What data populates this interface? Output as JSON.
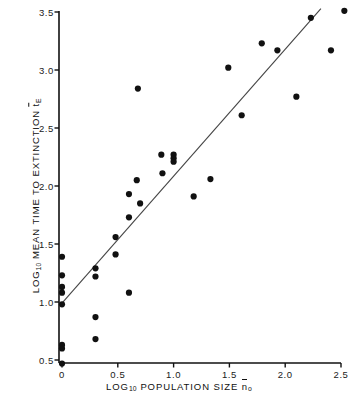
{
  "figure": {
    "background": "#ffffff",
    "ink_color": "#111111",
    "point_color": "#111111",
    "line_color": "#444444"
  },
  "axes": {
    "x_title_prefix": "LOG",
    "x_title_sub": "10",
    "x_title_main": " POPULATION SIZE ",
    "x_title_var": "n",
    "x_title_var_sub": "o",
    "y_title_prefix": "LOG",
    "y_title_sub": "10",
    "y_title_main": " MEAN TIME TO EXTINCTION ",
    "y_title_var": "t",
    "y_title_var_sub": "E",
    "x_ticks": [
      "0",
      "0.5",
      "1.0",
      "1.5",
      "2.0",
      "2.5"
    ],
    "x_tick_values": [
      0,
      0.5,
      1.0,
      1.5,
      2.0,
      2.5
    ],
    "y_ticks": [
      "0.5",
      "1.0",
      "1.5",
      "2.0",
      "2.5",
      "3.0",
      "3.5"
    ],
    "y_tick_values": [
      0.5,
      1.0,
      1.5,
      2.0,
      2.5,
      3.0,
      3.5
    ]
  },
  "chart_data": {
    "type": "scatter",
    "title": "",
    "xlabel": "LOG10 POPULATION SIZE n̂o",
    "ylabel": "LOG10 MEAN TIME TO EXTINCTION t̄E",
    "xlim": [
      0.0,
      2.5
    ],
    "ylim": [
      0.42,
      3.56
    ],
    "grid": false,
    "legend": "none",
    "points": [
      {
        "x": 0.0,
        "y": 1.39
      },
      {
        "x": 0.0,
        "y": 1.23
      },
      {
        "x": 0.0,
        "y": 1.13
      },
      {
        "x": 0.0,
        "y": 1.08
      },
      {
        "x": 0.0,
        "y": 0.98
      },
      {
        "x": 0.0,
        "y": 0.63
      },
      {
        "x": 0.0,
        "y": 0.6
      },
      {
        "x": 0.0,
        "y": 0.47
      },
      {
        "x": 0.3,
        "y": 1.29
      },
      {
        "x": 0.3,
        "y": 1.22
      },
      {
        "x": 0.3,
        "y": 0.87
      },
      {
        "x": 0.3,
        "y": 0.68
      },
      {
        "x": 0.48,
        "y": 1.56
      },
      {
        "x": 0.48,
        "y": 1.41
      },
      {
        "x": 0.6,
        "y": 1.93
      },
      {
        "x": 0.6,
        "y": 1.73
      },
      {
        "x": 0.6,
        "y": 1.08
      },
      {
        "x": 0.67,
        "y": 2.05
      },
      {
        "x": 0.68,
        "y": 2.84
      },
      {
        "x": 0.7,
        "y": 1.85
      },
      {
        "x": 0.89,
        "y": 2.27
      },
      {
        "x": 0.9,
        "y": 2.11
      },
      {
        "x": 1.0,
        "y": 2.27
      },
      {
        "x": 1.0,
        "y": 2.24
      },
      {
        "x": 1.0,
        "y": 2.21
      },
      {
        "x": 1.18,
        "y": 1.91
      },
      {
        "x": 1.33,
        "y": 2.06
      },
      {
        "x": 1.49,
        "y": 3.02
      },
      {
        "x": 1.61,
        "y": 2.61
      },
      {
        "x": 1.79,
        "y": 3.23
      },
      {
        "x": 1.93,
        "y": 3.17
      },
      {
        "x": 2.1,
        "y": 2.77
      },
      {
        "x": 2.23,
        "y": 3.45
      },
      {
        "x": 2.41,
        "y": 3.17
      },
      {
        "x": 2.53,
        "y": 3.51
      }
    ],
    "regression_line": {
      "x_start": 0.0,
      "y_start": 0.99,
      "x_end": 2.32,
      "y_end": 3.53
    }
  }
}
